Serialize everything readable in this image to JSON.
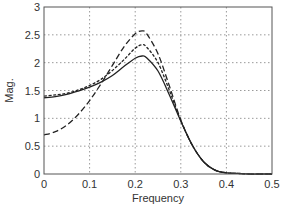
{
  "chart_data": {
    "type": "line",
    "title": "",
    "xlabel": "Frequency",
    "ylabel": "Mag.",
    "xlim": [
      0,
      0.5
    ],
    "ylim": [
      0,
      3
    ],
    "xticks": [
      0,
      0.1,
      0.2,
      0.3,
      0.4,
      0.5
    ],
    "yticks": [
      0,
      0.5,
      1,
      1.5,
      2,
      2.5,
      3
    ],
    "xtick_labels": [
      "0",
      "0.1",
      "0.2",
      "0.3",
      "0.4",
      "0.5"
    ],
    "ytick_labels": [
      "0",
      "0.5",
      "1",
      "1.5",
      "2",
      "2.5",
      "3"
    ],
    "grid": true,
    "legend": null,
    "x": [
      0,
      0.025,
      0.05,
      0.075,
      0.1,
      0.125,
      0.15,
      0.175,
      0.2,
      0.215,
      0.225,
      0.25,
      0.275,
      0.3,
      0.325,
      0.35,
      0.375,
      0.4,
      0.425,
      0.45,
      0.475,
      0.5
    ],
    "series": [
      {
        "name": "solid",
        "style": "solid",
        "color": "#222222",
        "values": [
          1.37,
          1.39,
          1.43,
          1.49,
          1.56,
          1.65,
          1.77,
          1.93,
          2.08,
          2.12,
          2.09,
          1.85,
          1.42,
          0.95,
          0.52,
          0.22,
          0.07,
          0.02,
          0.01,
          0.0,
          0.0,
          0.0
        ]
      },
      {
        "name": "dotted",
        "style": "dotted",
        "color": "#222222",
        "values": [
          1.4,
          1.42,
          1.45,
          1.51,
          1.59,
          1.7,
          1.86,
          2.05,
          2.26,
          2.32,
          2.28,
          2.0,
          1.5,
          0.96,
          0.52,
          0.22,
          0.07,
          0.02,
          0.01,
          0.0,
          0.0,
          0.0
        ]
      },
      {
        "name": "dashed",
        "style": "dashed",
        "color": "#222222",
        "values": [
          0.7,
          0.76,
          0.88,
          1.07,
          1.32,
          1.62,
          1.95,
          2.28,
          2.52,
          2.57,
          2.52,
          2.16,
          1.58,
          0.97,
          0.52,
          0.22,
          0.07,
          0.02,
          0.01,
          0.0,
          0.0,
          0.0
        ]
      }
    ]
  },
  "plot_area": {
    "left": 44,
    "top": 7,
    "right": 272,
    "bottom": 174
  }
}
